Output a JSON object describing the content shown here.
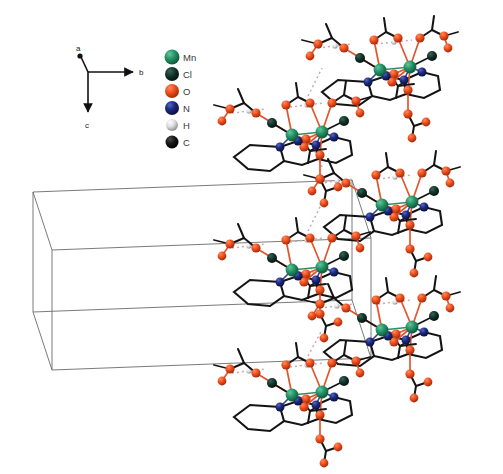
{
  "figure": {
    "background_color": "#ffffff",
    "width": 503,
    "height": 474
  },
  "axis_indicator": {
    "name": "crystallographic-axes",
    "axes": [
      {
        "label": "a",
        "direction": "up-left-foreshortened"
      },
      {
        "label": "b",
        "direction": "right"
      },
      {
        "label": "c",
        "direction": "down"
      }
    ],
    "origin": {
      "x": 88,
      "y": 72
    },
    "color": "#111111"
  },
  "legend": {
    "name": "atom-color-legend",
    "entries": [
      {
        "label": "Mn",
        "color": "#1f8a61",
        "radius": 7.5,
        "element": "manganese"
      },
      {
        "label": "Cl",
        "color": "#0f2e24",
        "radius": 7.0,
        "element": "chlorine"
      },
      {
        "label": "O",
        "color": "#f04a20",
        "radius": 7.0,
        "element": "oxygen"
      },
      {
        "label": "N",
        "color": "#1b2a7a",
        "radius": 7.0,
        "element": "nitrogen"
      },
      {
        "label": "H",
        "color": "#d8d8d8",
        "radius": 6.0,
        "element": "hydrogen"
      },
      {
        "label": "C",
        "color": "#111111",
        "radius": 6.5,
        "element": "carbon"
      }
    ],
    "x": 172,
    "y_start": 57,
    "y_step": 17
  },
  "unit_cell": {
    "name": "unit-cell-box",
    "line_color": "#6b6b6b",
    "line_width": 0.9,
    "front_face": [
      {
        "x": 33,
        "y": 192
      },
      {
        "x": 352,
        "y": 180
      },
      {
        "x": 352,
        "y": 300
      },
      {
        "x": 33,
        "y": 312
      }
    ],
    "depth_offset": {
      "dx": 62,
      "dy": 58
    }
  },
  "bonds": {
    "covalent_color": "#141414",
    "metal_bond_color": "#2f8f68",
    "oxygen_bond_color": "#e2552c",
    "nitrogen_bond_color": "#31408f",
    "hydrogen_bond_color": "#c8a8b4",
    "hydrogen_bond_dash": "2,3"
  },
  "molecular_units": {
    "count": 5,
    "description": "Dinuclear Mn carboxylate complexes with bipyridine ligands, linked into a staircase chain by O-H...O hydrogen bonds",
    "positions": [
      {
        "id": "unit-1",
        "x": 388,
        "y": 70,
        "scale": 1.0
      },
      {
        "id": "unit-2",
        "x": 300,
        "y": 135,
        "scale": 1.0
      },
      {
        "id": "unit-3",
        "x": 390,
        "y": 205,
        "scale": 1.0
      },
      {
        "id": "unit-4",
        "x": 300,
        "y": 270,
        "scale": 1.0
      },
      {
        "id": "unit-5",
        "x": 390,
        "y": 330,
        "scale": 1.0
      },
      {
        "id": "unit-6",
        "x": 300,
        "y": 395,
        "scale": 1.0
      }
    ]
  }
}
